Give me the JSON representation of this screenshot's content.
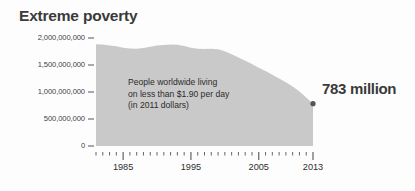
{
  "chart_data": {
    "type": "area",
    "title": "Extreme poverty",
    "xlabel": "",
    "ylabel": "",
    "grid": false,
    "legend": "none",
    "annotation_lines": [
      "People worldwide living",
      "on less than $1.90 per day",
      "(in 2011 dollars)"
    ],
    "callout": {
      "label": "783 million",
      "x": 2013,
      "y": 783000000
    },
    "xlim": [
      1981,
      2013
    ],
    "ylim": [
      0,
      2000000000
    ],
    "y_ticks": [
      0,
      500000000,
      1000000000,
      1500000000,
      2000000000
    ],
    "y_tick_labels": [
      "0",
      "500,000,000",
      "1,000,000,000",
      "1,500,000,000",
      "2,000,000,000"
    ],
    "x_ticks": [
      1985,
      1995,
      2005,
      2013
    ],
    "x_tick_labels": [
      "1985",
      "1995",
      "2005",
      "2013"
    ],
    "x_minor_tick_interval": 1,
    "series_name": "People living in extreme poverty",
    "x": [
      1981,
      1982,
      1983,
      1984,
      1985,
      1986,
      1987,
      1988,
      1989,
      1990,
      1991,
      1992,
      1993,
      1994,
      1995,
      1996,
      1997,
      1998,
      1999,
      2000,
      2001,
      2002,
      2003,
      2004,
      2005,
      2006,
      2007,
      2008,
      2009,
      2010,
      2011,
      2012,
      2013
    ],
    "values": [
      1885000000,
      1880000000,
      1862000000,
      1845000000,
      1820000000,
      1805000000,
      1800000000,
      1815000000,
      1840000000,
      1860000000,
      1872000000,
      1878000000,
      1876000000,
      1850000000,
      1820000000,
      1800000000,
      1795000000,
      1800000000,
      1790000000,
      1755000000,
      1700000000,
      1640000000,
      1580000000,
      1520000000,
      1450000000,
      1390000000,
      1320000000,
      1250000000,
      1180000000,
      1100000000,
      1010000000,
      900000000,
      783000000
    ],
    "colors": {
      "area_fill": "#c9c9c9",
      "title": "#3a3a3a",
      "axis": "#555555",
      "marker": "#555555",
      "text": "#2b2b2b",
      "background": "#fdfdfd"
    }
  }
}
